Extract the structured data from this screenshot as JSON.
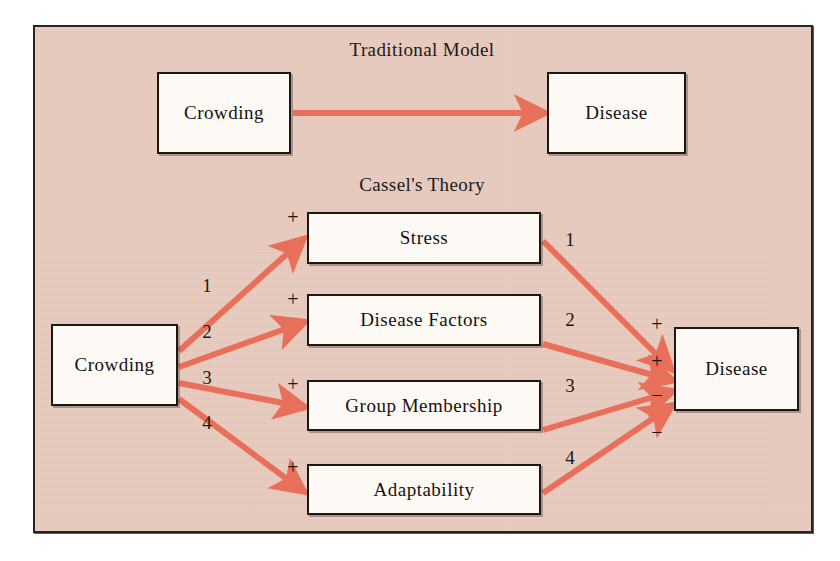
{
  "figure": {
    "background_color": "#e9cabe",
    "arrow_color": "#e8705a",
    "border_color": "#1d1714"
  },
  "traditional": {
    "title": "Traditional Model",
    "source": "Crowding",
    "target": "Disease"
  },
  "cassel": {
    "title": "Cassel's Theory",
    "source": "Crowding",
    "target": "Disease",
    "mediators": [
      {
        "label": "Stress",
        "path_number": "1",
        "in_sign": "+",
        "out_sign": "+"
      },
      {
        "label": "Disease Factors",
        "path_number": "2",
        "in_sign": "+",
        "out_sign": "+"
      },
      {
        "label": "Group Membership",
        "path_number": "3",
        "in_sign": "+",
        "out_sign": "−"
      },
      {
        "label": "Adaptability",
        "path_number": "4",
        "in_sign": "+",
        "out_sign": "−"
      }
    ],
    "left_numbers": [
      "1",
      "2",
      "3",
      "4"
    ],
    "right_numbers": [
      "1",
      "2",
      "3",
      "4"
    ]
  }
}
